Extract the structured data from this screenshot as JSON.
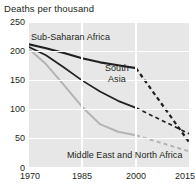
{
  "chart_data": {
    "type": "line",
    "title": "Deaths per thousand",
    "xlabel": "",
    "ylabel": "",
    "xlim": [
      1970,
      2015
    ],
    "ylim": [
      0,
      250
    ],
    "xticks": [
      "1970",
      "1985",
      "2000",
      "2015"
    ],
    "xtick_values": [
      1970,
      1985,
      2000,
      2015
    ],
    "yticks": [
      "0",
      "50",
      "100",
      "150",
      "200",
      "250"
    ],
    "ytick_values": [
      0,
      50,
      100,
      150,
      200,
      250
    ],
    "grid": "white gridlines on gray plot background",
    "legend": "inline series labels",
    "plot_background": "#e7e7e7",
    "gridline_color": "#ffffff",
    "series": [
      {
        "name": "Sub-Saharan Africa",
        "color": "#231f20",
        "width": 2.2,
        "label_position": "upper-left",
        "x": [
          1970,
          1975,
          1980,
          1985,
          1990,
          1995,
          2000
        ],
        "values": [
          212,
          205,
          197,
          188,
          181,
          176,
          171
        ],
        "projection_style": "dashed",
        "projection_x": [
          2000,
          2015
        ],
        "projection_values": [
          171,
          42
        ]
      },
      {
        "name": "South Asia",
        "color": "#231f20",
        "width": 1.7,
        "label_position": "middle-right",
        "x": [
          1970,
          1975,
          1980,
          1985,
          1990,
          1995,
          2000
        ],
        "values": [
          208,
          193,
          172,
          150,
          131,
          115,
          103
        ],
        "projection_style": "dashed",
        "projection_x": [
          2000,
          2015
        ],
        "projection_values": [
          103,
          58
        ]
      },
      {
        "name": "Middle East and North Africa",
        "color": "#b4b4b4",
        "width": 2.0,
        "label_position": "bottom-center",
        "x": [
          1970,
          1975,
          1980,
          1985,
          1990,
          1995,
          2000
        ],
        "values": [
          205,
          178,
          142,
          105,
          75,
          62,
          56
        ],
        "projection_style": "dashed",
        "projection_x": [
          2000,
          2015
        ],
        "projection_values": [
          56,
          28
        ]
      }
    ],
    "labels": {
      "sub_saharan_africa": "Sub-Saharan Africa",
      "south_asia_line1": "South",
      "south_asia_line2": "Asia",
      "middle_east_north_africa": "Middle East and North Africa"
    }
  }
}
